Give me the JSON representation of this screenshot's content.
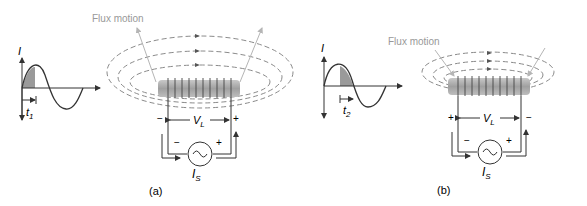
{
  "panels": [
    {
      "id": "a",
      "caption": "(a)",
      "flux_label": "Flux motion",
      "flux_direction": "outward",
      "current_axis_label": "I",
      "time_label": "t",
      "time_subscript": "1",
      "voltage_label": "V",
      "voltage_subscript": "L",
      "source_label": "I",
      "source_subscript": "S",
      "left_polarity": "−",
      "right_polarity": "+",
      "source_left_polarity": "−",
      "source_right_polarity": "+"
    },
    {
      "id": "b",
      "caption": "(b)",
      "flux_label": "Flux motion",
      "flux_direction": "inward",
      "current_axis_label": "I",
      "time_label": "t",
      "time_subscript": "2",
      "voltage_label": "V",
      "voltage_subscript": "L",
      "source_label": "I",
      "source_subscript": "S",
      "left_polarity": "+",
      "right_polarity": "−",
      "source_left_polarity": "−",
      "source_right_polarity": "+"
    }
  ],
  "colors": {
    "line": "#333333",
    "flux": "#8a8a8a",
    "flux_arrow": "#b5b5b5",
    "core": "#a9a9a9",
    "shade": "#9a9a9a"
  }
}
